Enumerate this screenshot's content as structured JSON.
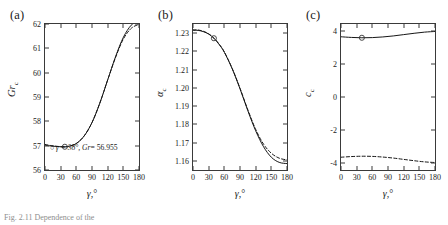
{
  "figure": {
    "caption": "Fig. 2.11 Dependence of the",
    "xlabel_html": "γ,°"
  },
  "panels": [
    {
      "label": "(a)",
      "name": "panel-a",
      "ylabel_main": "Gr",
      "ylabel_sub": "c",
      "xlabel": "γ,°",
      "yticks": [
        "56",
        "57",
        "58",
        "59",
        "60",
        "61",
        "62"
      ],
      "xticks": [
        "0",
        "30",
        "60",
        "90",
        "120",
        "150",
        "180"
      ],
      "annotation": {
        "marker": "○",
        "text_gamma": "γ = 38°,",
        "text_gr": "Gr",
        "text_value": "= 56.955"
      }
    },
    {
      "label": "(b)",
      "name": "panel-b",
      "ylabel_main": "α",
      "ylabel_sub": "c",
      "xlabel": "γ,°",
      "yticks": [
        "1.16",
        "1.17",
        "1.18",
        "1.19",
        "1.20",
        "1.21",
        "1.22",
        "1.23"
      ],
      "xticks": [
        "0",
        "30",
        "60",
        "90",
        "120",
        "150",
        "180"
      ]
    },
    {
      "label": "(c)",
      "name": "panel-c",
      "ylabel_main": "c",
      "ylabel_sub": "c",
      "xlabel": "γ,°",
      "yticks": [
        "-4",
        "-2",
        "0",
        "2",
        "4"
      ],
      "xticks": [
        "0",
        "30",
        "60",
        "90",
        "120",
        "150",
        "180"
      ]
    }
  ],
  "chart_data": [
    {
      "type": "line",
      "panel": "(a)",
      "title": "",
      "xlabel": "γ,°",
      "ylabel": "Gr_c",
      "xlim": [
        0,
        180
      ],
      "ylim": [
        56,
        62
      ],
      "xticks": [
        0,
        30,
        60,
        90,
        120,
        150,
        180
      ],
      "yticks": [
        56,
        57,
        58,
        59,
        60,
        61,
        62
      ],
      "grid": false,
      "legend": "none",
      "x": [
        0,
        10,
        20,
        30,
        38,
        45,
        60,
        75,
        90,
        105,
        120,
        135,
        150,
        165,
        180
      ],
      "series": [
        {
          "name": "solid",
          "style": "solid",
          "values": [
            57.02,
            56.99,
            56.97,
            56.955,
            56.955,
            56.97,
            57.09,
            57.4,
            57.95,
            58.75,
            59.7,
            60.65,
            61.45,
            61.95,
            62.18
          ]
        },
        {
          "name": "dashed",
          "style": "dashed",
          "values": [
            57.05,
            57.01,
            56.98,
            56.96,
            56.955,
            56.97,
            57.09,
            57.4,
            57.95,
            58.75,
            59.7,
            60.62,
            61.38,
            61.82,
            61.99
          ]
        }
      ],
      "markers": [
        {
          "x": 38,
          "y": 56.955,
          "symbol": "circle"
        }
      ],
      "annotations": [
        {
          "text": "γ = 38°, Gr = 56.955",
          "x": 38,
          "y": 56.4
        }
      ]
    },
    {
      "type": "line",
      "panel": "(b)",
      "title": "",
      "xlabel": "γ,°",
      "ylabel": "α_c",
      "xlim": [
        0,
        180
      ],
      "ylim": [
        1.155,
        1.235
      ],
      "xticks": [
        0,
        30,
        60,
        90,
        120,
        150,
        180
      ],
      "yticks": [
        1.16,
        1.17,
        1.18,
        1.19,
        1.2,
        1.21,
        1.22,
        1.23
      ],
      "grid": false,
      "legend": "none",
      "x": [
        0,
        10,
        20,
        30,
        40,
        50,
        60,
        75,
        90,
        105,
        120,
        135,
        150,
        165,
        180
      ],
      "series": [
        {
          "name": "solid",
          "style": "solid",
          "values": [
            1.2315,
            1.2315,
            1.2308,
            1.2295,
            1.2272,
            1.2238,
            1.2195,
            1.2105,
            1.1995,
            1.1875,
            1.1765,
            1.1678,
            1.162,
            1.1592,
            1.1585
          ]
        },
        {
          "name": "dashed",
          "style": "dashed",
          "values": [
            1.2318,
            1.2317,
            1.231,
            1.2296,
            1.2273,
            1.224,
            1.2197,
            1.2107,
            1.1998,
            1.188,
            1.1773,
            1.1692,
            1.1642,
            1.1615,
            1.1605
          ]
        }
      ],
      "markers": [
        {
          "x": 40,
          "y": 1.2272,
          "symbol": "circle"
        }
      ]
    },
    {
      "type": "line",
      "panel": "(c)",
      "title": "",
      "xlabel": "γ,°",
      "ylabel": "c_c",
      "xlim": [
        0,
        180
      ],
      "ylim": [
        -4.4,
        4.4
      ],
      "xticks": [
        0,
        30,
        60,
        90,
        120,
        150,
        180
      ],
      "yticks": [
        -4,
        -2,
        0,
        2,
        4
      ],
      "grid": false,
      "legend": "none",
      "x": [
        0,
        20,
        40,
        60,
        80,
        100,
        120,
        140,
        160,
        180
      ],
      "series": [
        {
          "name": "upper-solid",
          "style": "solid",
          "values": [
            3.63,
            3.59,
            3.57,
            3.58,
            3.62,
            3.68,
            3.76,
            3.84,
            3.91,
            3.95
          ]
        },
        {
          "name": "lower-dashed",
          "style": "dashed",
          "values": [
            -3.63,
            -3.59,
            -3.57,
            -3.58,
            -3.62,
            -3.68,
            -3.76,
            -3.84,
            -3.91,
            -3.95
          ]
        }
      ],
      "markers": [
        {
          "x": 40,
          "y": 3.57,
          "symbol": "circle"
        }
      ]
    }
  ]
}
